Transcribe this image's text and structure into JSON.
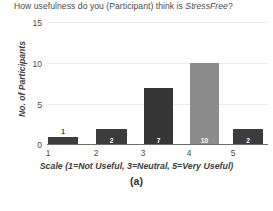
{
  "figure": {
    "caption": "(a)",
    "background": "#ffffff"
  },
  "chart_data": {
    "type": "bar",
    "title": "How usefulness do you (Participant) think is StressFree?",
    "title_plain_prefix": "How usefulness do you (Participant) think is ",
    "title_italic_word": "StressFree",
    "title_suffix": "?",
    "xlabel": "Scale (1=Not Useful, 3=Neutral, 5=Very Useful)",
    "ylabel": "No. of Participants",
    "categories": [
      "1",
      "2",
      "3",
      "4",
      "5"
    ],
    "values": [
      1,
      2,
      7,
      10,
      2
    ],
    "value_labels": [
      "1",
      "2",
      "7",
      "10",
      "2"
    ],
    "bar_colors": [
      "#3c3c3c",
      "#3c3c3c",
      "#363636",
      "#8c8c8c",
      "#3c3c3c"
    ],
    "label_placement": [
      "outside",
      "inside",
      "inside",
      "inside",
      "inside"
    ],
    "ylim": [
      0,
      15
    ],
    "yticks": [
      0,
      5,
      10,
      15
    ],
    "ytick_labels": [
      "0",
      "5",
      "10",
      "15"
    ],
    "grid": true,
    "grid_color": "#ebebeb",
    "legend": null,
    "axis_color": "#6e6e6e"
  }
}
